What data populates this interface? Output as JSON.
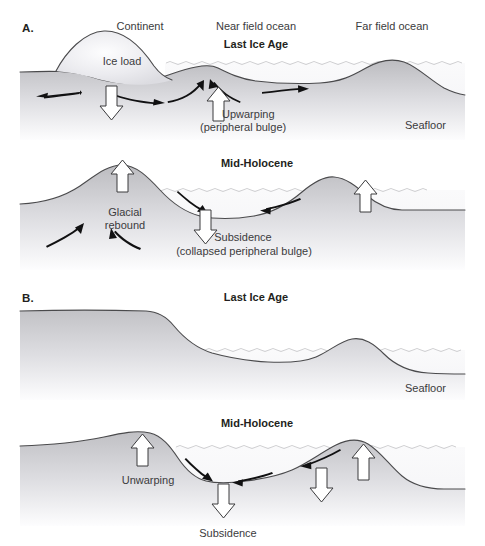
{
  "figure": {
    "panels": [
      {
        "letter": "A.",
        "subpanels": [
          {
            "title": "Last Ice Age",
            "top_labels": [
              "Continent",
              "Near field ocean",
              "Far field ocean"
            ],
            "inline_labels": [
              "Ice load",
              "Upwarping",
              "(peripheral bulge)",
              "Seafloor"
            ]
          },
          {
            "title": "Mid-Holocene",
            "inline_labels": [
              "Glacial",
              "rebound",
              "Subsidence",
              "(collapsed peripheral bulge)"
            ]
          }
        ]
      },
      {
        "letter": "B.",
        "subpanels": [
          {
            "title": "Last Ice Age",
            "inline_labels": [
              "Seafloor"
            ]
          },
          {
            "title": "Mid-Holocene",
            "inline_labels": [
              "Unwarping",
              "Subsidence"
            ]
          }
        ]
      }
    ]
  },
  "panelA": {
    "letter": "A.",
    "labels": {
      "continent": "Continent",
      "near_field_ocean": "Near field ocean",
      "far_field_ocean": "Far field ocean",
      "last_ice_age": "Last Ice Age",
      "ice_load": "Ice load",
      "upwarping": "Upwarping",
      "peripheral_bulge": "(peripheral bulge)",
      "seafloor": "Seafloor",
      "mid_holocene": "Mid-Holocene",
      "glacial": "Glacial",
      "rebound": "rebound",
      "subsidence": "Subsidence",
      "collapsed_peripheral_bulge": "(collapsed peripheral bulge)"
    }
  },
  "panelB": {
    "letter": "B.",
    "labels": {
      "last_ice_age": "Last Ice Age",
      "seafloor": "Seafloor",
      "mid_holocene": "Mid-Holocene",
      "unwarping": "Unwarping",
      "subsidence": "Subsidence"
    }
  },
  "colors": {
    "outline": "#4a4a4c",
    "water_outline": "#c9c9cc",
    "earth_dark": "#c3c3c6",
    "earth_light": "#ffffff",
    "ice_fill": "#ededf0",
    "water_fill": "#f7f7f9",
    "arrow_black": "#111112",
    "arrow_white_fill": "#ffffff",
    "text": "#231f20",
    "text_muted": "#3b3b3d",
    "background": "#ffffff"
  }
}
